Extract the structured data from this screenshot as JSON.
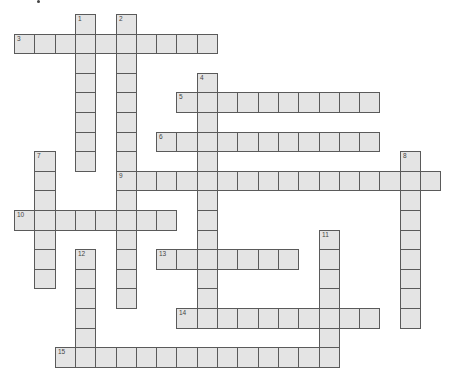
{
  "puzzle": {
    "type": "crossword",
    "cell_size": {
      "w": 20.3,
      "h": 19.6
    },
    "origin": {
      "x": 14,
      "y": 14
    },
    "cell_fill": "#e4e4e4",
    "cell_border": "#5a5a5a",
    "words": [
      {
        "number": "1",
        "direction": "down",
        "col": 3,
        "row": 0,
        "length": 8
      },
      {
        "number": "2",
        "direction": "down",
        "col": 5,
        "row": 0,
        "length": 15
      },
      {
        "number": "3",
        "direction": "across",
        "col": 0,
        "row": 1,
        "length": 10
      },
      {
        "number": "4",
        "direction": "down",
        "col": 9,
        "row": 3,
        "length": 13
      },
      {
        "number": "5",
        "direction": "across",
        "col": 8,
        "row": 4,
        "length": 10
      },
      {
        "number": "6",
        "direction": "across",
        "col": 7,
        "row": 6,
        "length": 11
      },
      {
        "number": "7",
        "direction": "down",
        "col": 1,
        "row": 7,
        "length": 7
      },
      {
        "number": "8",
        "direction": "down",
        "col": 19,
        "row": 7,
        "length": 9
      },
      {
        "number": "9",
        "direction": "across",
        "col": 5,
        "row": 8,
        "length": 16
      },
      {
        "number": "10",
        "direction": "across",
        "col": 0,
        "row": 10,
        "length": 8
      },
      {
        "number": "11",
        "direction": "down",
        "col": 15,
        "row": 11,
        "length": 7
      },
      {
        "number": "12",
        "direction": "down",
        "col": 3,
        "row": 12,
        "length": 6
      },
      {
        "number": "13",
        "direction": "across",
        "col": 7,
        "row": 12,
        "length": 7
      },
      {
        "number": "14",
        "direction": "across",
        "col": 8,
        "row": 15,
        "length": 10
      },
      {
        "number": "15",
        "direction": "across",
        "col": 2,
        "row": 17,
        "length": 14
      }
    ]
  }
}
